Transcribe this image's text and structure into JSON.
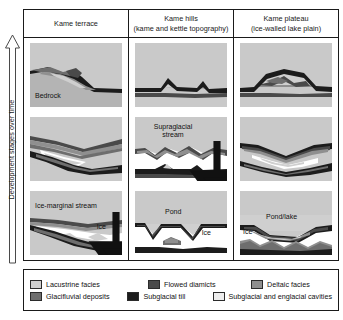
{
  "axis": {
    "label": "Development stages over time",
    "direction": "up"
  },
  "columns": [
    {
      "title": "Kame terrace",
      "subtitle": ""
    },
    {
      "title": "Kame hills",
      "subtitle": "(kame and kettle topography)"
    },
    {
      "title": "Kame plateau",
      "subtitle": "(ice-walled lake plain)"
    }
  ],
  "panels": {
    "r1c1": {
      "labels": [
        {
          "text": "Bedrock"
        }
      ]
    },
    "r1c2": {
      "labels": []
    },
    "r1c3": {
      "labels": []
    },
    "r2c1": {
      "labels": []
    },
    "r2c2": {
      "labels": [
        {
          "text": "Supraglacial",
          "text2": "stream"
        }
      ]
    },
    "r2c3": {
      "labels": []
    },
    "r3c1": {
      "labels": [
        {
          "text": "Ice-marginal stream"
        },
        {
          "text": "Ice"
        }
      ]
    },
    "r3c2": {
      "labels": [
        {
          "text": "Pond"
        },
        {
          "text": "Ice"
        }
      ]
    },
    "r3c3": {
      "labels": [
        {
          "text": "Pond/lake"
        },
        {
          "text": "Ice"
        }
      ]
    }
  },
  "legend": {
    "row1": [
      {
        "label": "Lacustrine facies",
        "color": "#cfcfcf"
      },
      {
        "label": "Flowed diamicts",
        "color": "#4a4a4a"
      },
      {
        "label": "Deltaic facies",
        "color": "#8f8f8f"
      }
    ],
    "row2": [
      {
        "label": "Glacifluvial deposits",
        "color": "#6e6e6e"
      },
      {
        "label": "Subglacial till",
        "color": "#1c1c1c"
      },
      {
        "label": "Subglacial and englacial cavities",
        "color": "#ededed"
      }
    ]
  },
  "palette": {
    "background": "#c9c9c9",
    "lacustrine": "#cfcfcf",
    "deltaic": "#8f8f8f",
    "glacifluvial": "#6e6e6e",
    "flowed_diamicts": "#4a4a4a",
    "subglacial_till": "#1c1c1c",
    "cavities": "#ffffff",
    "bedrock": "#b4b4b4",
    "outline": "#1a1a1a"
  }
}
